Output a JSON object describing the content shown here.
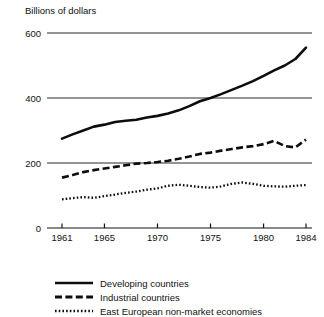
{
  "chart_data": {
    "type": "line",
    "title": "Billions of dollars",
    "xlabel": "",
    "ylabel": "Billions of dollars",
    "xlim": [
      1961,
      1984
    ],
    "ylim": [
      0,
      600
    ],
    "grid": true,
    "gridlines": [
      200,
      400,
      600
    ],
    "legend_position": "bottom-left",
    "y_ticks": [
      0,
      200,
      400,
      600
    ],
    "y_tick_labels": [
      "0",
      "200",
      "400",
      "600"
    ],
    "x_ticks": [
      1961,
      1965,
      1970,
      1975,
      1980,
      1984
    ],
    "x_tick_labels": [
      "1961",
      "1965",
      "1970",
      "1975",
      "1980",
      "1984"
    ],
    "x": [
      1961,
      1962,
      1963,
      1964,
      1965,
      1966,
      1967,
      1968,
      1969,
      1970,
      1971,
      1972,
      1973,
      1974,
      1975,
      1976,
      1977,
      1978,
      1979,
      1980,
      1981,
      1982,
      1983,
      1984
    ],
    "series": [
      {
        "name": "Developing countries",
        "style": "solid",
        "color": "#0d0d0d",
        "values": [
          275,
          288,
          300,
          312,
          318,
          326,
          330,
          333,
          340,
          345,
          352,
          362,
          375,
          390,
          400,
          412,
          425,
          438,
          452,
          468,
          485,
          500,
          520,
          555
        ]
      },
      {
        "name": "Industrial countries",
        "style": "dashed",
        "color": "#0d0d0d",
        "values": [
          155,
          163,
          172,
          178,
          183,
          188,
          193,
          198,
          200,
          203,
          207,
          213,
          220,
          228,
          232,
          238,
          243,
          248,
          252,
          258,
          268,
          252,
          248,
          272
        ]
      },
      {
        "name": "East European non-market economies",
        "style": "dotted",
        "color": "#0d0d0d",
        "values": [
          88,
          92,
          95,
          93,
          98,
          103,
          108,
          112,
          118,
          122,
          130,
          133,
          130,
          126,
          124,
          128,
          136,
          140,
          136,
          130,
          128,
          127,
          130,
          132
        ]
      }
    ]
  },
  "legend": {
    "items": [
      {
        "label": "Developing countries",
        "style": "solid"
      },
      {
        "label": "Industrial countries",
        "style": "dashed"
      },
      {
        "label": "East European non-market economies",
        "style": "dotted"
      }
    ]
  }
}
